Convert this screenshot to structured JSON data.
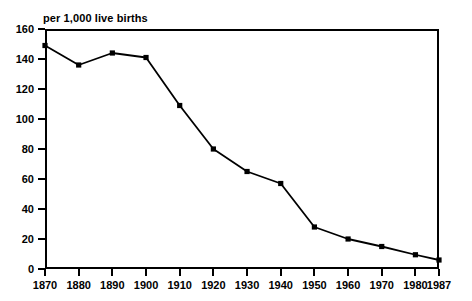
{
  "chart_data": {
    "type": "line",
    "title": "per 1,000 live births",
    "subtitle": "",
    "xlabel": "",
    "ylabel": "",
    "x": [
      1870,
      1880,
      1890,
      1900,
      1910,
      1920,
      1930,
      1940,
      1950,
      1960,
      1970,
      1980,
      1987
    ],
    "values": [
      149,
      136,
      144,
      141,
      109,
      80,
      65,
      57,
      28,
      20,
      15,
      9.5,
      6
    ],
    "xtick_labels": [
      "1870",
      "1880",
      "1890",
      "1900",
      "1910",
      "1920",
      "1930",
      "1940",
      "1950",
      "1960",
      "1970",
      "1980",
      "1987"
    ],
    "ytick_labels": [
      "0",
      "20",
      "40",
      "60",
      "80",
      "100",
      "120",
      "140",
      "160"
    ],
    "ytick_values": [
      0,
      20,
      40,
      60,
      80,
      100,
      120,
      140,
      160
    ],
    "xlim": [
      1870,
      1987
    ],
    "ylim": [
      0,
      160
    ],
    "grid": false,
    "legend": false,
    "legend_position": "none",
    "series_color": "#000000",
    "marker": "square",
    "axis_color": "#000000",
    "background_color": "#ffffff"
  }
}
